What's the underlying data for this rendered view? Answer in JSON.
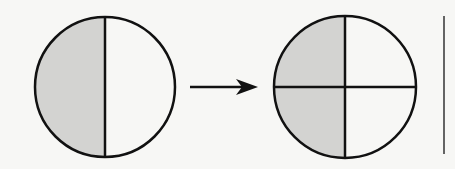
{
  "diagram": {
    "colors": {
      "shade": "#d3d3d1",
      "stroke": "#111111",
      "background": "#f7f7f5"
    },
    "left_circle": {
      "parts": 2,
      "shaded": 1,
      "fraction": "1/2"
    },
    "arrow": {
      "direction": "right"
    },
    "right_circle": {
      "parts": 4,
      "shaded": 2,
      "fraction": "2/4"
    },
    "separator": {
      "orientation": "vertical"
    }
  }
}
